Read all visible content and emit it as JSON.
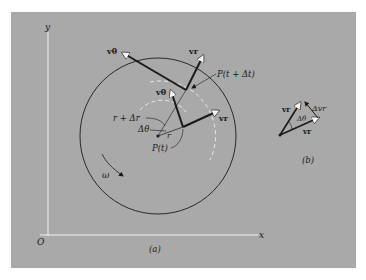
{
  "figure": {
    "axes": {
      "x_label": "x",
      "y_label": "y",
      "origin_label": "O"
    },
    "panel_a": {
      "caption": "(a)",
      "labels": {
        "v_theta_outer": "vθ",
        "v_r_outer": "vr",
        "v_theta_inner": "vθ",
        "v_r_inner": "vr",
        "p_t_dt": "P(t + Δt)",
        "p_t": "P(t)",
        "r_plus_dr": "r + Δr",
        "d_theta": "Δθ",
        "r": "r",
        "omega": "ω"
      }
    },
    "panel_b": {
      "caption": "(b)",
      "labels": {
        "v_r_left": "vr",
        "v_r_bottom": "vr",
        "delta_v_r": "Δvr",
        "d_theta": "Δθ"
      }
    },
    "colors": {
      "background": "#a9a9a9",
      "ink": "#1a1a1a",
      "axis": "#f2f2f2",
      "arrowhead_fill": "#f5f5f5"
    }
  }
}
